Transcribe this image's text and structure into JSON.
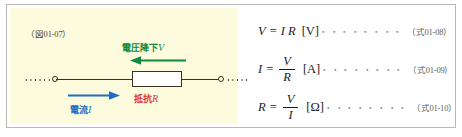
{
  "figure": {
    "caption": "（図01-07）",
    "panel_bg": "#fcfbdd",
    "circuit": {
      "voltage_drop": {
        "text": "電圧降下",
        "symbol": "V",
        "color": "#128a3c",
        "arrow_direction": "left",
        "arrow_icon": "left-arrow-icon"
      },
      "current": {
        "text": "電流",
        "symbol": "I",
        "color": "#1b6fc4",
        "arrow_direction": "right",
        "arrow_icon": "right-arrow-icon"
      },
      "resistance": {
        "text": "抵抗",
        "symbol": "R",
        "color": "#d8383a",
        "component": "resistor-box"
      },
      "wire_color": "#3a3222",
      "terminal_count": 2
    }
  },
  "equations": [
    {
      "id": "eq-01-08",
      "lhs": "V",
      "rel": "=",
      "rhs_inline": "I R",
      "fraction": null,
      "unit": "[V]",
      "leader": "・・・・・・・・",
      "number": "（式01-08）"
    },
    {
      "id": "eq-01-09",
      "lhs": "I",
      "rel": "=",
      "rhs_inline": null,
      "fraction": {
        "numerator": "V",
        "denominator": "R"
      },
      "unit": "[A]",
      "leader": "・・・・・・・・",
      "number": "（式01-09）"
    },
    {
      "id": "eq-01-10",
      "lhs": "R",
      "rel": "=",
      "rhs_inline": null,
      "fraction": {
        "numerator": "V",
        "denominator": "I"
      },
      "unit": "[Ω]",
      "leader": "・・・・・・・・",
      "number": "（式01-10）"
    }
  ]
}
